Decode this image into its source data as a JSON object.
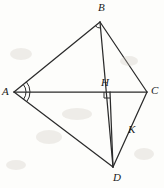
{
  "figure": {
    "stroke_color": "#2b2b2b",
    "background_color": "#fdfdfb",
    "label_color": "#1a1a1a",
    "canvas": {
      "width": 164,
      "height": 188
    }
  },
  "points": {
    "A": {
      "label": "A",
      "x": 14,
      "y": 92,
      "label_x": 2,
      "label_y": 86
    },
    "B": {
      "label": "B",
      "x": 100,
      "y": 22,
      "label_x": 98,
      "label_y": 2
    },
    "C": {
      "label": "C",
      "x": 147,
      "y": 92,
      "label_x": 151,
      "label_y": 85
    },
    "D": {
      "label": "D",
      "x": 113,
      "y": 167,
      "label_x": 113,
      "label_y": 172
    },
    "H": {
      "label": "H",
      "x": 110,
      "y": 92,
      "label_x": 101,
      "label_y": 77
    },
    "K": {
      "label": "K",
      "x": 125,
      "y": 128,
      "label_x": 128,
      "label_y": 124
    }
  },
  "segments": [
    {
      "name": "segment-AB",
      "from": "A",
      "to": "B"
    },
    {
      "name": "segment-AC",
      "from": "A",
      "to": "C"
    },
    {
      "name": "segment-AD",
      "from": "A",
      "to": "D"
    },
    {
      "name": "segment-BC",
      "from": "B",
      "to": "C"
    },
    {
      "name": "segment-BD",
      "from": "B",
      "to": "D"
    },
    {
      "name": "segment-CD",
      "from": "C",
      "to": "D"
    },
    {
      "name": "segment-HD",
      "from": "H",
      "to": "D"
    }
  ],
  "markers": {
    "right_angle": {
      "name": "right-angle-marker-H",
      "at": "H",
      "size": 6,
      "description": "right angle at H between AC and HD"
    },
    "angle_arcs": {
      "name": "angle-bisector-arcs-A",
      "at": "A",
      "count": 2,
      "description": "double arc at vertex A marking equal angles BAC and CAD"
    },
    "small_angle_arc": {
      "name": "angle-arc-B",
      "at": "B",
      "count": 1,
      "description": "small arc at vertex B"
    }
  },
  "smudges": [
    {
      "x": 10,
      "y": 48,
      "w": 22,
      "h": 12
    },
    {
      "x": 36,
      "y": 130,
      "w": 26,
      "h": 14
    },
    {
      "x": 120,
      "y": 56,
      "w": 18,
      "h": 10
    },
    {
      "x": 62,
      "y": 108,
      "w": 30,
      "h": 12
    },
    {
      "x": 6,
      "y": 160,
      "w": 20,
      "h": 10
    },
    {
      "x": 134,
      "y": 148,
      "w": 20,
      "h": 12
    }
  ]
}
